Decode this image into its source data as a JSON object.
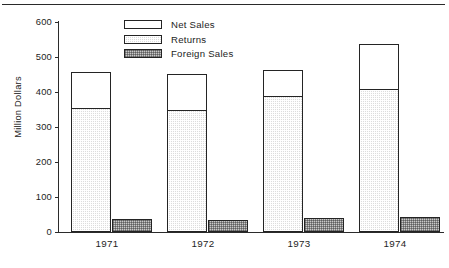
{
  "chart_data": {
    "type": "bar",
    "title": "",
    "subtitle": "",
    "xlabel": "",
    "ylabel": "Million Dollars",
    "categories": [
      "1971",
      "1972",
      "1973",
      "1974"
    ],
    "ylim": [
      0,
      600
    ],
    "yticks": [
      0,
      100,
      200,
      300,
      400,
      500,
      600
    ],
    "ytick_labels": [
      "0",
      "100",
      "200",
      "300",
      "400",
      "500",
      "600"
    ],
    "grid": false,
    "legend_position": "top-center-left",
    "stacked": true,
    "series": [
      {
        "name": "Net Sales",
        "pattern": "white",
        "stack": "main",
        "values": [
          101,
          100,
          73,
          127
        ]
      },
      {
        "name": "Returns",
        "pattern": "light-stipple",
        "stack": "main",
        "values": [
          357,
          352,
          391,
          410
        ]
      },
      {
        "name": "Foreign Sales",
        "pattern": "dense-stipple",
        "stack": "side",
        "values": [
          37,
          35,
          41,
          42
        ]
      }
    ],
    "stack_totals": [
      458,
      452,
      464,
      537
    ],
    "annotations": []
  },
  "legend": {
    "items": [
      {
        "label": "Net Sales",
        "swatch": "white"
      },
      {
        "label": "Returns",
        "swatch": "light-stipple"
      },
      {
        "label": "Foreign Sales",
        "swatch": "dense-stipple"
      }
    ]
  },
  "caption": {
    "text": ""
  },
  "colors": {
    "ink": "#242424",
    "returns_fill": "#dcdcdc",
    "foreign_fill": "#c9c9c9",
    "net_fill": "#ffffff"
  }
}
